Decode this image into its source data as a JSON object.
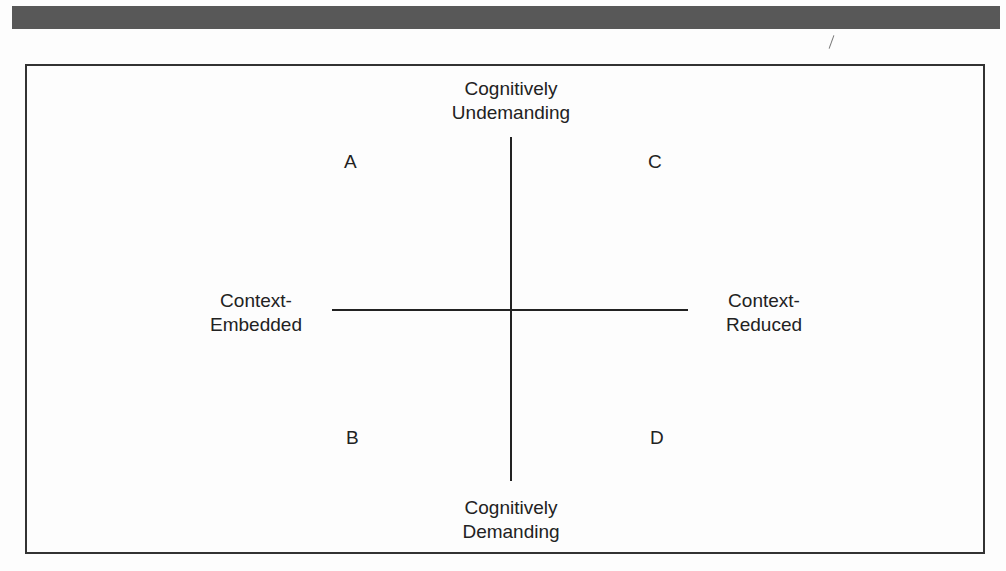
{
  "diagram": {
    "type": "quadrant",
    "axes": {
      "vertical": {
        "top_label": [
          "Cognitively",
          "Undemanding"
        ],
        "bottom_label": [
          "Cognitively",
          "Demanding"
        ]
      },
      "horizontal": {
        "left_label": [
          "Context-",
          "Embedded"
        ],
        "right_label": [
          "Context-",
          "Reduced"
        ]
      }
    },
    "quadrants": {
      "top_left": "A",
      "top_right": "C",
      "bottom_left": "B",
      "bottom_right": "D"
    }
  }
}
